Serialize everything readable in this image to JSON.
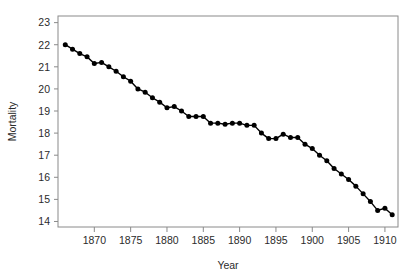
{
  "figure": {
    "background_color": "#ffffff",
    "frame_color": "#8a8a8a",
    "series_color": "#000000",
    "text_color": "#2b2b2b"
  },
  "axes": {
    "x_title": "Year",
    "y_title": "Mortality",
    "x_tick_labels": [
      "1870",
      "1875",
      "1880",
      "1885",
      "1890",
      "1895",
      "1900",
      "1905",
      "1910"
    ],
    "y_tick_labels": [
      "14",
      "15",
      "16",
      "17",
      "18",
      "19",
      "20",
      "21",
      "22",
      "23"
    ]
  },
  "chart_data": {
    "type": "line",
    "title": "",
    "xlabel": "Year",
    "ylabel": "Mortality",
    "xlim": [
      1865.0,
      1911.8
    ],
    "ylim": [
      13.75,
      23.3
    ],
    "xticks": [
      1870,
      1875,
      1880,
      1885,
      1890,
      1895,
      1900,
      1905,
      1910
    ],
    "yticks": [
      14,
      15,
      16,
      17,
      18,
      19,
      20,
      21,
      22,
      23
    ],
    "grid": false,
    "legend": "none",
    "marker": "filled-circle",
    "x": [
      1866,
      1867,
      1868,
      1869,
      1870,
      1871,
      1872,
      1873,
      1874,
      1875,
      1876,
      1877,
      1878,
      1879,
      1880,
      1881,
      1882,
      1883,
      1884,
      1885,
      1886,
      1887,
      1888,
      1889,
      1890,
      1891,
      1892,
      1893,
      1894,
      1895,
      1896,
      1897,
      1898,
      1899,
      1900,
      1901,
      1902,
      1903,
      1904,
      1905,
      1906,
      1907,
      1908,
      1909,
      1910,
      1911
    ],
    "series": [
      {
        "name": "Mortality",
        "values": [
          22.0,
          21.8,
          21.6,
          21.45,
          21.15,
          21.2,
          21.0,
          20.8,
          20.55,
          20.35,
          20.0,
          19.85,
          19.6,
          19.4,
          19.15,
          19.2,
          19.0,
          18.75,
          18.75,
          18.75,
          18.45,
          18.45,
          18.4,
          18.45,
          18.45,
          18.35,
          18.35,
          18.0,
          17.75,
          17.75,
          17.95,
          17.8,
          17.8,
          17.5,
          17.3,
          17.0,
          16.75,
          16.4,
          16.15,
          15.9,
          15.6,
          15.25,
          14.9,
          14.5,
          14.6,
          14.3
        ]
      }
    ]
  }
}
